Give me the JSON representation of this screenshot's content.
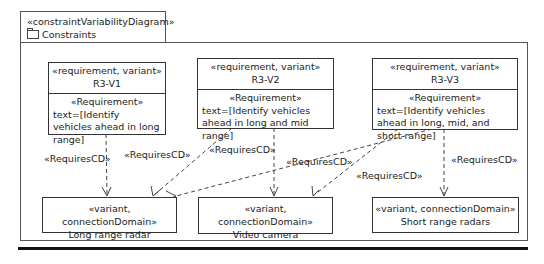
{
  "diagram": {
    "stereotype": "«constraintVariabilityDiagram»",
    "title": "Constraints",
    "icon": "folder-icon"
  },
  "requirements": [
    {
      "stereotype": "«requirement, variant»",
      "name": "R3-V1",
      "body_stereotype": "«Requirement»",
      "text": "text=[Identify vehicles ahead in long range]"
    },
    {
      "stereotype": "«requirement, variant»",
      "name": "R3-V2",
      "body_stereotype": "«Requirement»",
      "text": "text=[Identify vehicles ahead in long and mid range]"
    },
    {
      "stereotype": "«requirement, variant»",
      "name": "R3-V3",
      "body_stereotype": "«Requirement»",
      "text": "text=[Identify vehicles ahead in long, mid, and short range]"
    }
  ],
  "domains": [
    {
      "stereotype": "«variant, connectionDomain»",
      "name": "Long range radar"
    },
    {
      "stereotype": "«variant, connectionDomain»",
      "name": "Video camera"
    },
    {
      "stereotype": "«variant, connectionDomain»",
      "name": "Short range radars"
    }
  ],
  "relations": [
    {
      "from": "R3-V1",
      "to": "Long range radar",
      "label": "«RequiresCD»"
    },
    {
      "from": "R3-V2",
      "to": "Long range radar",
      "label": "«RequiresCD»"
    },
    {
      "from": "R3-V3",
      "to": "Long range radar",
      "label": "«RequiresCD»"
    },
    {
      "from": "R3-V2",
      "to": "Video camera",
      "label": "«RequiresCD»"
    },
    {
      "from": "R3-V3",
      "to": "Video camera",
      "label": "«RequiresCD»"
    },
    {
      "from": "R3-V3",
      "to": "Short range radars",
      "label": "«RequiresCD»"
    }
  ]
}
